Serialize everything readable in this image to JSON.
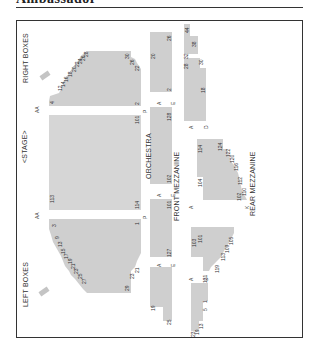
{
  "header": {
    "title": "Ambassador"
  },
  "chart": {
    "stage_label": "<STAGE>",
    "sections": {
      "orchestra": "ORCHESTRA",
      "front_mezzanine": "FRONT MEZZANINE",
      "rear_mezzanine": "REAR MEZZANINE",
      "right_boxes": "RIGHT BOXES",
      "left_boxes": "LEFT BOXES"
    },
    "row_labels": {
      "orch_first_row": "AA",
      "orch_last_row": "P",
      "orch_first_row_b": "AA",
      "orch_last_row_b": "P",
      "fmezz_first_row": "A",
      "fmezz_last_row": "E",
      "fmezz_first_row_b": "A",
      "fmezz_last_row_b": "E",
      "fmezz_first_row_c": "A",
      "fmezz_last_row_c": "E",
      "rmezz_first_row": "A",
      "rmezz_last_row": "D",
      "rmezz_first_row_b": "A",
      "rmezz_last_row_b": "K",
      "rmezz_first_row_c": "A",
      "rmezz_last_row_c": "D"
    },
    "seat_numbers": {
      "orch_right": [
        "4",
        "12",
        "14",
        "16",
        "18",
        "20",
        "22",
        "24",
        "26",
        "28",
        "30",
        "26",
        "22",
        "2"
      ],
      "orch_center": [
        "113",
        "101",
        "114",
        "1"
      ],
      "orch_left": [
        "1",
        "3",
        "9",
        "13",
        "15",
        "17",
        "19",
        "21",
        "23",
        "25",
        "27",
        "29",
        "23",
        "21"
      ],
      "fmezz_right": [
        "20",
        "26",
        "2",
        "128"
      ],
      "fmezz_center": [
        "102",
        "101",
        "127"
      ],
      "fmezz_left": [
        "19",
        "25"
      ],
      "rmezz_right": [
        "44",
        "38",
        "32",
        "28",
        "30",
        "18"
      ],
      "rmezz_center": [
        "124",
        "122",
        "120",
        "116",
        "112",
        "110",
        "102",
        "104",
        "114"
      ],
      "rmezz_left_center": [
        "103",
        "101",
        "105",
        "109",
        "113",
        "119",
        "121"
      ],
      "rmezz_left": [
        "1",
        "5",
        "13",
        "19",
        "23"
      ]
    },
    "colors": {
      "section_fill": "#cfcfcf",
      "frame": "#333333",
      "text": "#333333"
    }
  }
}
